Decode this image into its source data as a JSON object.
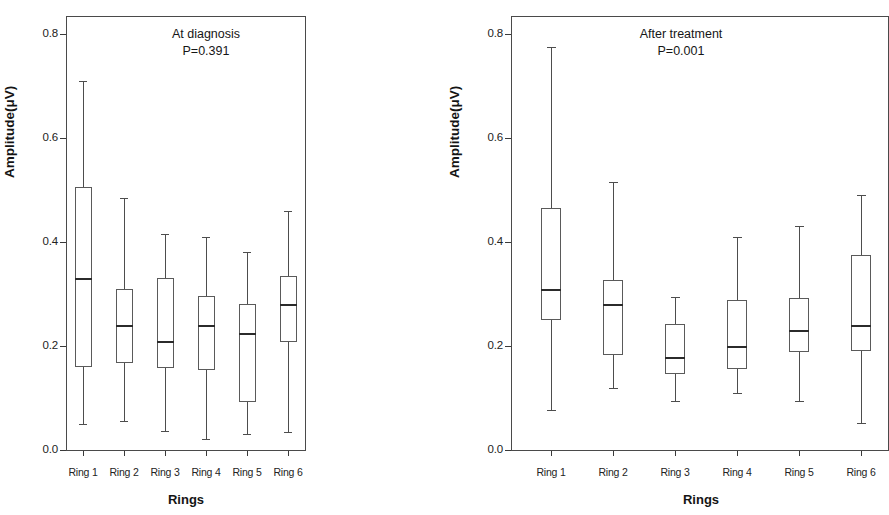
{
  "figure": {
    "y_axis_title": "Amplitude(μV)",
    "x_axis_title": "Rings",
    "y_ticks": [
      "0.8",
      "0.6",
      "0.4",
      "0.2",
      "0.0"
    ],
    "x_ticks": [
      "Ring 1",
      "Ring 2",
      "Ring 3",
      "Ring 4",
      "Ring 5",
      "Ring 6"
    ],
    "panels": [
      {
        "title": "At diagnosis",
        "pvalue": "P=0.391"
      },
      {
        "title": "After treatment",
        "pvalue": "P=0.001"
      }
    ]
  },
  "chart_data": [
    {
      "type": "box",
      "title": "At diagnosis",
      "annotation": "P=0.391",
      "xlabel": "Rings",
      "ylabel": "Amplitude(μV)",
      "ylim": [
        0.0,
        0.84
      ],
      "yticks": [
        0.0,
        0.2,
        0.4,
        0.6,
        0.8
      ],
      "grid": false,
      "categories": [
        "Ring 1",
        "Ring 2",
        "Ring 3",
        "Ring 4",
        "Ring 5",
        "Ring 6"
      ],
      "boxes": [
        {
          "category": "Ring 1",
          "whisker_low": 0.05,
          "q1": 0.16,
          "median": 0.33,
          "q3": 0.505,
          "whisker_high": 0.71
        },
        {
          "category": "Ring 2",
          "whisker_low": 0.056,
          "q1": 0.168,
          "median": 0.24,
          "q3": 0.31,
          "whisker_high": 0.485
        },
        {
          "category": "Ring 3",
          "whisker_low": 0.037,
          "q1": 0.157,
          "median": 0.21,
          "q3": 0.33,
          "whisker_high": 0.415
        },
        {
          "category": "Ring 4",
          "whisker_low": 0.021,
          "q1": 0.153,
          "median": 0.24,
          "q3": 0.297,
          "whisker_high": 0.409
        },
        {
          "category": "Ring 5",
          "whisker_low": 0.03,
          "q1": 0.093,
          "median": 0.225,
          "q3": 0.28,
          "whisker_high": 0.38
        },
        {
          "category": "Ring 6",
          "whisker_low": 0.035,
          "q1": 0.208,
          "median": 0.28,
          "q3": 0.335,
          "whisker_high": 0.46
        }
      ]
    },
    {
      "type": "box",
      "title": "After treatment",
      "annotation": "P=0.001",
      "xlabel": "Rings",
      "ylabel": "Amplitude(μV)",
      "ylim": [
        0.0,
        0.84
      ],
      "yticks": [
        0.0,
        0.2,
        0.4,
        0.6,
        0.8
      ],
      "grid": false,
      "categories": [
        "Ring 1",
        "Ring 2",
        "Ring 3",
        "Ring 4",
        "Ring 5",
        "Ring 6"
      ],
      "boxes": [
        {
          "category": "Ring 1",
          "whisker_low": 0.077,
          "q1": 0.25,
          "median": 0.31,
          "q3": 0.465,
          "whisker_high": 0.775
        },
        {
          "category": "Ring 2",
          "whisker_low": 0.119,
          "q1": 0.183,
          "median": 0.28,
          "q3": 0.327,
          "whisker_high": 0.515
        },
        {
          "category": "Ring 3",
          "whisker_low": 0.094,
          "q1": 0.146,
          "median": 0.178,
          "q3": 0.243,
          "whisker_high": 0.294
        },
        {
          "category": "Ring 4",
          "whisker_low": 0.109,
          "q1": 0.155,
          "median": 0.2,
          "q3": 0.288,
          "whisker_high": 0.409
        },
        {
          "category": "Ring 5",
          "whisker_low": 0.094,
          "q1": 0.188,
          "median": 0.23,
          "q3": 0.293,
          "whisker_high": 0.43
        },
        {
          "category": "Ring 6",
          "whisker_low": 0.051,
          "q1": 0.19,
          "median": 0.24,
          "q3": 0.375,
          "whisker_high": 0.49
        }
      ]
    }
  ]
}
